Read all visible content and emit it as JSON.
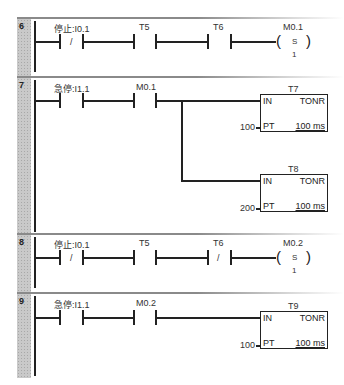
{
  "networks": [
    {
      "number": "6",
      "contacts": [
        {
          "label": "停止:I0.1",
          "type": "NC",
          "symbol": "/"
        },
        {
          "label": "T5",
          "type": "NO",
          "symbol": ""
        },
        {
          "label": "T6",
          "type": "NO",
          "symbol": ""
        }
      ],
      "coil": {
        "label": "M0.1",
        "op": "S",
        "count": "1"
      }
    },
    {
      "number": "7",
      "contacts": [
        {
          "label": "急停:I1.1",
          "type": "NO",
          "symbol": ""
        },
        {
          "label": "M0.1",
          "type": "NO",
          "symbol": ""
        }
      ],
      "timers": [
        {
          "name": "T7",
          "in": "IN",
          "type": "TONR",
          "pt_label": "PT",
          "pt_value": "100",
          "resolution": "100 ms"
        },
        {
          "name": "T8",
          "in": "IN",
          "type": "TONR",
          "pt_label": "PT",
          "pt_value": "200",
          "resolution": "100 ms"
        }
      ]
    },
    {
      "number": "8",
      "contacts": [
        {
          "label": "停止:I0.1",
          "type": "NC",
          "symbol": "/"
        },
        {
          "label": "T5",
          "type": "NO",
          "symbol": ""
        },
        {
          "label": "T6",
          "type": "NC",
          "symbol": "/"
        }
      ],
      "coil": {
        "label": "M0.2",
        "op": "S",
        "count": "1"
      }
    },
    {
      "number": "9",
      "contacts": [
        {
          "label": "急停:I1.1",
          "type": "NO",
          "symbol": ""
        },
        {
          "label": "M0.2",
          "type": "NO",
          "symbol": ""
        }
      ],
      "timers": [
        {
          "name": "T9",
          "in": "IN",
          "type": "TONR",
          "pt_label": "PT",
          "pt_value": "100",
          "resolution": "100 ms"
        }
      ]
    }
  ]
}
